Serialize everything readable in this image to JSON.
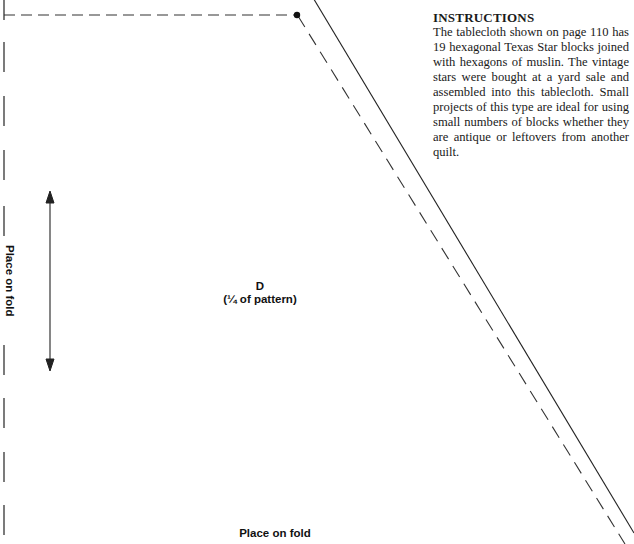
{
  "instructions": {
    "heading": "INSTRUCTIONS",
    "body": "The tablecloth shown on page 110 has 19 hexagonal Texas Star blocks joined with hexagons of muslin. The vintage stars were bought at a yard sale and assembled into this tablecloth. Small projects of this type are ideal for using small numbers of blocks whether they are antique or leftovers from another quilt."
  },
  "pattern": {
    "piece_letter": "D",
    "piece_note": "(¼ of pattern)",
    "fold_label_side": "Place on fold",
    "fold_label_bottom": "Place on fold",
    "icons": [
      "grainline-arrow-icon",
      "corner-dot-icon"
    ]
  }
}
